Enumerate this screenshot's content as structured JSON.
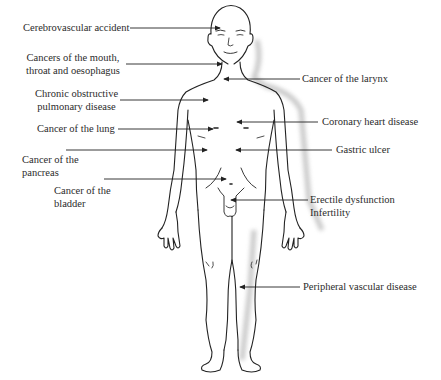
{
  "diagram": {
    "type": "anatomical-annotation",
    "labels_left": [
      {
        "id": "cva",
        "lines": [
          "Cerebrovascular accident"
        ]
      },
      {
        "id": "mouth",
        "lines": [
          "Cancers of the mouth,",
          "throat and oesophagus"
        ]
      },
      {
        "id": "copd",
        "lines": [
          "Chronic obstructive",
          "pulmonary disease"
        ]
      },
      {
        "id": "lung",
        "lines": [
          "Cancer of the lung"
        ]
      },
      {
        "id": "pancreas",
        "lines": [
          "Cancer of the",
          "pancreas"
        ]
      },
      {
        "id": "bladder",
        "lines": [
          "Cancer of the",
          "bladder"
        ]
      }
    ],
    "labels_right": [
      {
        "id": "larynx",
        "lines": [
          "Cancer of the larynx"
        ]
      },
      {
        "id": "chd",
        "lines": [
          "Coronary heart disease"
        ]
      },
      {
        "id": "gastric",
        "lines": [
          "Gastric ulcer"
        ]
      },
      {
        "id": "ed",
        "lines": [
          "Erectile dysfunction",
          "Infertility"
        ]
      },
      {
        "id": "pvd",
        "lines": [
          "Peripheral vascular disease"
        ]
      }
    ],
    "colors": {
      "line": "#222222",
      "text": "#2b2b2b",
      "shadow": "#c8c8c8",
      "background": "#ffffff"
    }
  }
}
